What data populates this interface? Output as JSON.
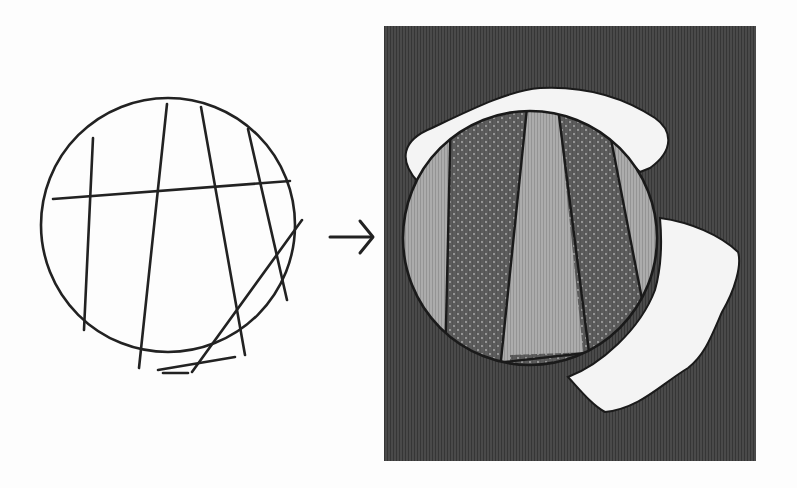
{
  "figure": {
    "left_panel": {
      "description": "Circle partitioned by line segments (chords)",
      "circle": {
        "cx": 168,
        "cy": 225,
        "r": 127
      },
      "stroke_color": "#222222",
      "chords": [
        {
          "x1": 93,
          "y1": 138,
          "x2": 84,
          "y2": 330
        },
        {
          "x1": 167,
          "y1": 104,
          "x2": 139,
          "y2": 368
        },
        {
          "x1": 201,
          "y1": 107,
          "x2": 245,
          "y2": 355
        },
        {
          "x1": 248,
          "y1": 129,
          "x2": 287,
          "y2": 300
        },
        {
          "x1": 53,
          "y1": 199,
          "x2": 290,
          "y2": 181
        },
        {
          "x1": 302,
          "y1": 220,
          "x2": 190,
          "y2": 372
        },
        {
          "x1": 155,
          "y1": 370,
          "x2": 235,
          "y2": 357
        },
        {
          "x1": 163,
          "y1": 372,
          "x2": 188,
          "y2": 372
        }
      ]
    },
    "arrow": {
      "label": "→",
      "color": "#222222"
    },
    "right_panel": {
      "description": "Same circle with regions filled by alternating patterns over a dark striped background with white blobs",
      "frame": {
        "x": 384,
        "y": 26,
        "width": 372,
        "height": 435
      },
      "colors": {
        "background": "#4a4a4a",
        "background_stripe": "#3a3a3a",
        "light_region": "#a9a9a9",
        "light_stripe": "#9a9a9a",
        "dark_dotted_region": "#5e5e5e",
        "dot": "#a0a0a0",
        "blob": "#f4f4f4",
        "outline": "#1a1a1a"
      },
      "circle": {
        "cx": 530,
        "cy": 238,
        "r": 127
      },
      "regions": [
        {
          "fill": "light",
          "label": "region-1"
        },
        {
          "fill": "dotted",
          "label": "region-2"
        },
        {
          "fill": "light",
          "label": "region-3"
        },
        {
          "fill": "dotted",
          "label": "region-4"
        },
        {
          "fill": "light",
          "label": "region-5"
        }
      ]
    }
  }
}
